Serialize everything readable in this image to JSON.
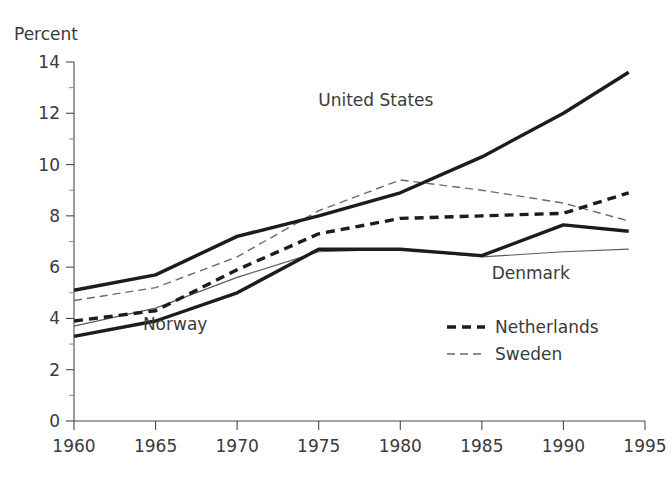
{
  "chart_data": {
    "type": "line",
    "title": "",
    "subtitle": "",
    "xlabel": "",
    "ylabel": "Percent",
    "ylabel_position": "top-left",
    "xlim": [
      1960,
      1995
    ],
    "ylim": [
      0,
      14
    ],
    "grid": false,
    "x_ticks": [
      1960,
      1965,
      1970,
      1975,
      1980,
      1985,
      1990,
      1995
    ],
    "x_tick_labels": [
      "1960",
      "1965",
      "1970",
      "1975",
      "1980",
      "1985",
      "1990",
      "1995"
    ],
    "y_ticks": [
      0,
      2,
      4,
      6,
      8,
      10,
      12,
      14
    ],
    "y_tick_labels": [
      "0",
      "2",
      "4",
      "6",
      "8",
      "10",
      "12",
      "14"
    ],
    "y_minor_ticks": [
      1,
      3,
      5,
      7,
      9,
      11,
      13
    ],
    "legend_position": "inside-lower-right",
    "x": [
      1960,
      1965,
      1970,
      1975,
      1980,
      1985,
      1990,
      1994
    ],
    "series": [
      {
        "name": "United States",
        "style": "thick-solid",
        "color": "#1c1c1c",
        "label_type": "inline",
        "values": [
          5.1,
          5.7,
          7.2,
          8.0,
          8.9,
          10.3,
          12.0,
          13.6
        ]
      },
      {
        "name": "Netherlands",
        "style": "thick-dashed",
        "color": "#1c1c1c",
        "label_type": "legend",
        "values": [
          3.9,
          4.3,
          5.9,
          7.3,
          7.9,
          8.0,
          8.1,
          8.9
        ]
      },
      {
        "name": "Sweden",
        "style": "thin-dashed",
        "color": "#6a6a6a",
        "label_type": "legend",
        "values": [
          4.7,
          5.2,
          6.4,
          8.2,
          9.4,
          9.0,
          8.5,
          7.8
        ]
      },
      {
        "name": "Norway",
        "style": "thick-solid",
        "color": "#1c1c1c",
        "label_type": "inline",
        "values": [
          3.3,
          3.9,
          5.0,
          6.7,
          6.7,
          6.45,
          7.65,
          7.4
        ]
      },
      {
        "name": "Denmark",
        "style": "thin-solid",
        "color": "#5d5d5d",
        "label_type": "inline",
        "values": [
          3.7,
          4.4,
          5.6,
          6.6,
          6.7,
          6.4,
          6.6,
          6.7
        ]
      }
    ],
    "inline_annotations": [
      {
        "text": "United States",
        "anchor_x": 1978.5,
        "anchor_y": 12.3
      },
      {
        "text": "Norway",
        "anchor_x": 1966.2,
        "anchor_y": 3.55
      },
      {
        "text": "Denmark",
        "anchor_x": 1988.0,
        "anchor_y": 5.55
      }
    ],
    "legend_entries": [
      {
        "label": "Netherlands",
        "style": "thick-dashed"
      },
      {
        "label": "Sweden",
        "style": "thin-dashed"
      }
    ]
  },
  "axis": {
    "y_title": "Percent"
  }
}
